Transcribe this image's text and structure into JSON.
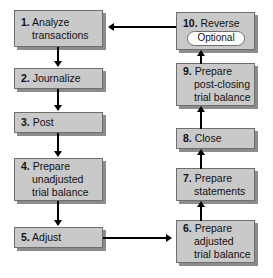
{
  "diagram": {
    "box_fill": "#c9c9c9",
    "box_border": "#6e6e6e",
    "arrow_color": "#000000",
    "background": "#ffffff"
  },
  "nodes": {
    "step1": {
      "num": "1.",
      "line1": "Analyze",
      "line2": "transactions"
    },
    "step2": {
      "num": "2.",
      "line1": "Journalize"
    },
    "step3": {
      "num": "3.",
      "line1": "Post"
    },
    "step4": {
      "num": "4.",
      "line1": "Prepare",
      "line2": "unadjusted",
      "line3": "trial balance"
    },
    "step5": {
      "num": "5.",
      "line1": "Adjust"
    },
    "step6": {
      "num": "6.",
      "line1": "Prepare",
      "line2": "adjusted",
      "line3": "trial balance"
    },
    "step7": {
      "num": "7.",
      "line1": "Prepare",
      "line2": "statements"
    },
    "step8": {
      "num": "8.",
      "line1": "Close"
    },
    "step9": {
      "num": "9.",
      "line1": "Prepare",
      "line2": "post-closing",
      "line3": "trial balance"
    },
    "step10": {
      "num": "10.",
      "line1": "Reverse",
      "badge": "Optional"
    }
  }
}
